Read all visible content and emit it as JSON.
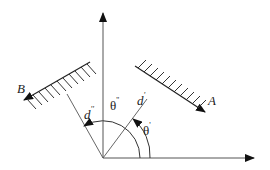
{
  "diagram": {
    "type": "geometry",
    "origin": {
      "x": 103,
      "y": 158
    },
    "axes": [
      {
        "name": "vertical-axis",
        "from": [
          103,
          158
        ],
        "to": [
          103,
          12
        ]
      },
      {
        "name": "horizontal-axis",
        "from": [
          103,
          158
        ],
        "to": [
          255,
          158
        ]
      }
    ],
    "walls": [
      {
        "name": "wall-a",
        "label": "A",
        "from": [
          135,
          66
        ],
        "to": [
          205,
          112
        ]
      },
      {
        "name": "wall-b",
        "label": "B",
        "from": [
          90,
          62
        ],
        "to": [
          24,
          100
        ]
      }
    ],
    "normals": [
      {
        "name": "normal-d-prime",
        "label": "d",
        "prime": "'",
        "to": [
          147,
          99
        ]
      },
      {
        "name": "normal-d-double-prime",
        "label": "d",
        "prime": "''",
        "to": [
          67,
          94
        ]
      }
    ],
    "angles": [
      {
        "name": "theta-prime",
        "label": "θ",
        "prime": "'"
      },
      {
        "name": "theta-double-prime",
        "label": "θ",
        "prime": "''"
      }
    ]
  },
  "labels": {
    "a": "A",
    "b": "B",
    "d": "d",
    "d_prime": "'",
    "d_double_prime": "''",
    "theta": "θ",
    "theta_prime": "'",
    "theta_double_prime": "''"
  }
}
